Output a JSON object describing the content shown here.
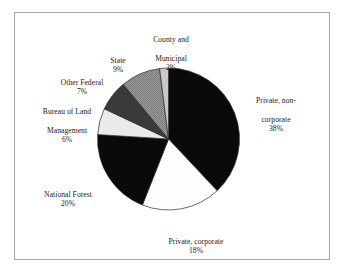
{
  "figure": {
    "background_color": "#ffffff",
    "border_color": "#a8a8a8"
  },
  "chart_data": {
    "type": "pie",
    "title": "",
    "subtitle": "",
    "xlabel": "",
    "ylabel": "",
    "legend_position": "none",
    "grid": false,
    "labels_outside": true,
    "start_angle_deg": 0,
    "direction": "clockwise",
    "units": "percent",
    "total": 100,
    "categories": [
      "Private, non-corporate",
      "Private, corporate",
      "National Forest",
      "Bureau of Land Management",
      "Other Federal",
      "State",
      "County and Municipal"
    ],
    "values": [
      38,
      18,
      20,
      6,
      7,
      9,
      2
    ],
    "slice_colors": [
      "#0a0a0a",
      "#fdfdfd",
      "#0a0a0a",
      "#eaeaea",
      "#3a3a3a",
      "#8f8f8f",
      "#c9c9c9"
    ],
    "slices": [
      {
        "name": "Private, non-corporate",
        "label_line1": "Private, non-",
        "label_line2": "corporate",
        "value": 38,
        "percent_label": "38%",
        "color": "#0a0a0a",
        "pattern": "solid"
      },
      {
        "name": "Private, corporate",
        "label_line1": "Private, corporate",
        "label_line2": "",
        "value": 18,
        "percent_label": "18%",
        "color": "#fdfdfd",
        "pattern": "solid"
      },
      {
        "name": "National Forest",
        "label_line1": "National Forest",
        "label_line2": "",
        "value": 20,
        "percent_label": "20%",
        "color": "#0a0a0a",
        "pattern": "solid"
      },
      {
        "name": "Bureau of Land Management",
        "label_line1": "Bureau of Land",
        "label_line2": "Management",
        "value": 6,
        "percent_label": "6%",
        "color": "#eaeaea",
        "pattern": "solid"
      },
      {
        "name": "Other Federal",
        "label_line1": "Other Federal",
        "label_line2": "",
        "value": 7,
        "percent_label": "7%",
        "color": "#3a3a3a",
        "pattern": "solid"
      },
      {
        "name": "State",
        "label_line1": "State",
        "label_line2": "",
        "value": 9,
        "percent_label": "9%",
        "color": "#8f8f8f",
        "pattern": "dotted-gray"
      },
      {
        "name": "County and Municipal",
        "label_line1": "County and",
        "label_line2": "Municipal",
        "value": 2,
        "percent_label": "2%",
        "color": "#c9c9c9",
        "pattern": "solid"
      }
    ]
  }
}
